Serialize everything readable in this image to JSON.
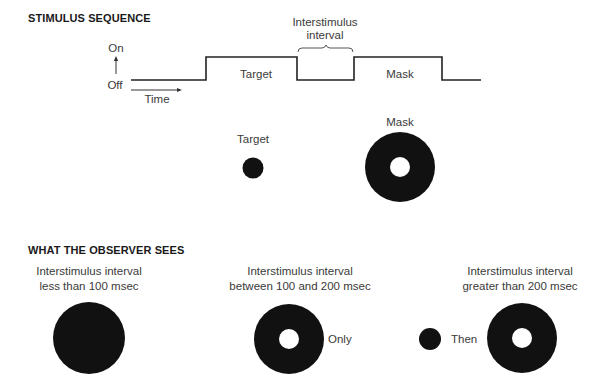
{
  "stimulus_sequence": {
    "heading": "STIMULUS SEQUENCE",
    "axis": {
      "on_label": "On",
      "off_label": "Off",
      "time_label": "Time"
    },
    "waveform_segments": [
      {
        "state": "off"
      },
      {
        "state": "on",
        "label": "Target"
      },
      {
        "state": "off",
        "label": "Interstimulus interval"
      },
      {
        "state": "on",
        "label": "Mask"
      },
      {
        "state": "off"
      }
    ],
    "interval_label_line1": "Interstimulus",
    "interval_label_line2": "interval",
    "target_pulse_label": "Target",
    "mask_pulse_label": "Mask",
    "stimuli": {
      "target_label": "Target",
      "mask_label": "Mask"
    }
  },
  "observer_sees": {
    "heading": "WHAT THE OBSERVER SEES",
    "conditions": [
      {
        "line1": "Interstimulus interval",
        "line2": "less than 100 msec",
        "percept": "solid disk"
      },
      {
        "line1": "Interstimulus interval",
        "line2": "between 100 and 200 msec",
        "percept": "ring",
        "note": "Only"
      },
      {
        "line1": "Interstimulus interval",
        "line2": "greater than 200 msec",
        "percept": "dot then ring",
        "note": "Then"
      }
    ]
  },
  "colors": {
    "ink": "#111111",
    "text": "#3a3a3a",
    "background": "#ffffff"
  }
}
